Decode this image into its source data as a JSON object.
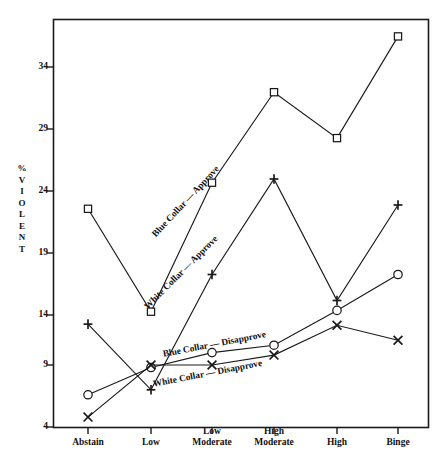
{
  "chart_data": {
    "type": "line",
    "title": "",
    "xlabel": "",
    "ylabel": "% VIOLENT",
    "ylim": [
      4,
      36.8
    ],
    "yticks": [
      4,
      9,
      14,
      19,
      24,
      29,
      34
    ],
    "grid": false,
    "legend_position": "inline-annotations",
    "categories": [
      "Abstain",
      "Low",
      "Low Moderate",
      "High Moderate",
      "High",
      "Binge"
    ],
    "series": [
      {
        "name": "Blue Collar — Approve",
        "marker": "square",
        "values": [
          21.6,
          13.3,
          23.7,
          31.0,
          27.3,
          35.5
        ]
      },
      {
        "name": "White Collar — Approve",
        "marker": "plus",
        "values": [
          12.3,
          7.0,
          16.3,
          24.0,
          14.2,
          21.9
        ]
      },
      {
        "name": "Blue Collar — Disapprove",
        "marker": "circle",
        "values": [
          6.6,
          8.8,
          10.0,
          10.6,
          13.4,
          16.3
        ]
      },
      {
        "name": "White Collar — Disapprove",
        "marker": "x",
        "values": [
          4.8,
          9.0,
          9.0,
          9.8,
          12.2,
          11.0
        ]
      }
    ],
    "annotations": [
      {
        "text": "Blue Collar — Approve",
        "series": "Blue Collar — Approve"
      },
      {
        "text": "White Collar — Approve",
        "series": "White Collar — Approve"
      },
      {
        "text": "Blue Collar — Disapprove",
        "series": "Blue Collar — Disapprove"
      },
      {
        "text": "White Collar — Disapprove",
        "series": "White Collar — Disapprove"
      }
    ],
    "colors": {
      "line": "#1a1a1a",
      "marker_fill": "#ffffff",
      "axis": "#1a1a1a",
      "background": "#ffffff"
    }
  },
  "axis": {
    "y_title_chars": [
      "%",
      "V",
      "I",
      "O",
      "L",
      "E",
      "N",
      "T"
    ],
    "y_tick_labels": [
      "34",
      "29",
      "24",
      "19",
      "14",
      "9",
      "4"
    ],
    "x_tick_labels": [
      {
        "line1": "Abstain",
        "line2": ""
      },
      {
        "line1": "Low",
        "line2": ""
      },
      {
        "line1": "Low",
        "line2": "Moderate"
      },
      {
        "line1": "High",
        "line2": "Moderate"
      },
      {
        "line1": "High",
        "line2": ""
      },
      {
        "line1": "Binge",
        "line2": ""
      }
    ]
  },
  "annotation_labels": {
    "blue_approve": "Blue Collar — Approve",
    "white_approve": "White Collar — Approve",
    "blue_disapprove": "Blue Collar — Disapprove",
    "white_disapprove": "White Collar — Disapprove"
  }
}
